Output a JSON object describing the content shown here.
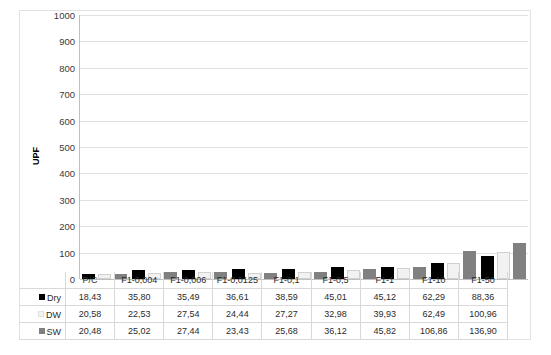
{
  "chart_data": {
    "type": "bar",
    "title": "",
    "xlabel": "",
    "ylabel": "UPF",
    "ylim": [
      0,
      1000
    ],
    "ytick_step": 100,
    "yticks": [
      "1000",
      "900",
      "800",
      "700",
      "600",
      "500",
      "400",
      "300",
      "200",
      "100",
      "0"
    ],
    "grid": true,
    "legend_position": "data-table-row-headers",
    "categories": [
      "P/C",
      "F1-0,004",
      "F1-0,006",
      "F1-0,0125",
      "F1-0,1",
      "F1-0,5",
      "F1-1",
      "F1-10",
      "F1-50"
    ],
    "series": [
      {
        "name": "Dry",
        "color": "#000000",
        "values": [
          18.43,
          35.8,
          35.49,
          36.61,
          38.59,
          45.01,
          45.12,
          62.29,
          88.36
        ],
        "labels": [
          "18,43",
          "35,80",
          "35,49",
          "36,61",
          "38,59",
          "45,01",
          "45,12",
          "62,29",
          "88,36"
        ]
      },
      {
        "name": "DW",
        "color": "#f2f2f2",
        "values": [
          20.58,
          22.53,
          27.54,
          24.44,
          27.27,
          32.98,
          39.93,
          62.49,
          100.96
        ],
        "labels": [
          "20,58",
          "22,53",
          "27,54",
          "24,44",
          "27,27",
          "32,98",
          "39,93",
          "62,49",
          "100,96"
        ]
      },
      {
        "name": "SW",
        "color": "#808080",
        "values": [
          20.48,
          25.02,
          27.44,
          23.43,
          25.68,
          36.12,
          45.82,
          106.86,
          136.9
        ],
        "labels": [
          "20,48",
          "25,02",
          "27,44",
          "23,43",
          "25,68",
          "36,12",
          "45,82",
          "106,86",
          "136,90"
        ]
      }
    ]
  }
}
